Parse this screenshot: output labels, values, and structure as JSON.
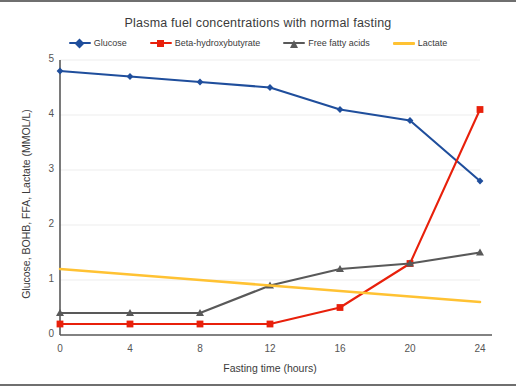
{
  "chart_data": {
    "type": "line",
    "title": "Plasma fuel concentrations with normal fasting",
    "xlabel": "Fasting time (hours)",
    "ylabel": "Glucose, BOHB, FFA, Lactate (MMOL/L)",
    "x": [
      0,
      4,
      8,
      12,
      16,
      20,
      24
    ],
    "xtick_labels": [
      "0",
      "4",
      "8",
      "12",
      "16",
      "20",
      "24"
    ],
    "ytick_labels": [
      "0",
      "1",
      "2",
      "3",
      "4",
      "5"
    ],
    "xlim": [
      0,
      24
    ],
    "ylim": [
      0,
      5
    ],
    "grid": "horizontal",
    "legend_position": "top-center",
    "series": [
      {
        "name": "Glucose",
        "color": "#1F4E9C",
        "marker": "diamond",
        "values": [
          4.8,
          4.7,
          4.6,
          4.5,
          4.1,
          3.9,
          2.8
        ]
      },
      {
        "name": "Beta-hydroxybutyrate",
        "color": "#E8200B",
        "marker": "square",
        "values": [
          0.2,
          0.2,
          0.2,
          0.2,
          0.5,
          1.3,
          4.1
        ]
      },
      {
        "name": "Free fatty acids",
        "color": "#595959",
        "marker": "triangle",
        "values": [
          0.4,
          0.4,
          0.4,
          0.9,
          1.2,
          1.3,
          1.5
        ]
      },
      {
        "name": "Lactate",
        "color": "#FFC233",
        "marker": "none",
        "values": [
          1.2,
          1.1,
          1.0,
          0.9,
          0.8,
          0.7,
          0.6
        ]
      }
    ]
  },
  "colors": {
    "background": "#ffffff",
    "frame": "#6f6f6f",
    "axis": "#595959",
    "grid": "#ededed",
    "text": "#3b3b3b"
  }
}
